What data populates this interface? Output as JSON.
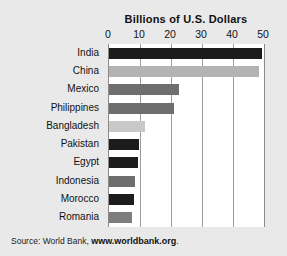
{
  "figure": {
    "background_color": "#e9e9e9",
    "plot_background_color": "#ffffff"
  },
  "chart_data": {
    "type": "bar",
    "orientation": "horizontal",
    "title": "Billions of U.S. Dollars",
    "xlabel": "",
    "ylabel": "",
    "xlim": [
      0,
      50
    ],
    "xticks": [
      0,
      10,
      20,
      30,
      40,
      50
    ],
    "xtick_labels": [
      "0",
      "10",
      "20",
      "30",
      "40",
      "50"
    ],
    "grid": true,
    "grid_axis": "x",
    "legend": false,
    "categories": [
      "India",
      "China",
      "Mexico",
      "Philippines",
      "Bangladesh",
      "Pakistan",
      "Egypt",
      "Indonesia",
      "Morocco",
      "Romania"
    ],
    "values": [
      49.5,
      48.5,
      22.5,
      21.0,
      11.5,
      9.8,
      9.2,
      8.5,
      8.0,
      7.3
    ],
    "bar_colors": [
      "#1c1c1c",
      "#b3b3b3",
      "#6e6e6e",
      "#6e6e6e",
      "#c8c8c8",
      "#1c1c1c",
      "#1c1c1c",
      "#6e6e6e",
      "#1c1c1c",
      "#7d7d7d"
    ]
  },
  "source": {
    "prefix": "Source: World Bank,",
    "url": "www.worldbank.org",
    "suffix": "."
  }
}
